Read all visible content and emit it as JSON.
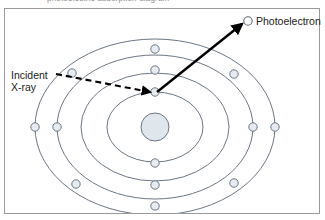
{
  "figure": {
    "caption_sliver": "photoelectric absorption diagram",
    "frame_color": "#9a9a9a",
    "background": "#ffffff"
  },
  "labels": {
    "photoelectron": "Photoelectron",
    "incident_line1": "Incident",
    "incident_line2": "X-ray"
  },
  "diagram": {
    "type": "atomic-shell-photoelectric-effect",
    "nucleus": {
      "name": "nucleus",
      "cx": 155,
      "cy": 127,
      "r": 14,
      "fill": "#dfe6ec",
      "stroke": "#6b7785"
    },
    "shell_color": "#6b7785",
    "electron_fill": "#e6ecf2",
    "electron_stroke": "#6b7785",
    "electron_radius": 4.2,
    "shells": [
      {
        "name": "shell-1",
        "rx": 48,
        "ry": 35
      },
      {
        "name": "shell-2",
        "rx": 74,
        "ry": 54
      },
      {
        "name": "shell-3",
        "rx": 98,
        "ry": 72
      },
      {
        "name": "shell-4",
        "rx": 120,
        "ry": 88
      }
    ],
    "electrons": [
      {
        "name": "electron-shell2-top",
        "cx": 155,
        "cy": 92
      },
      {
        "name": "electron-shell3-top",
        "cx": 155,
        "cy": 70
      },
      {
        "name": "electron-shell4-top",
        "cx": 155,
        "cy": 49
      },
      {
        "name": "electron-shell2-bottom",
        "cx": 155,
        "cy": 163
      },
      {
        "name": "electron-shell3-bottom",
        "cx": 155,
        "cy": 185
      },
      {
        "name": "electron-shell4-bottom",
        "cx": 155,
        "cy": 206
      },
      {
        "name": "electron-shell3-left",
        "cx": 57,
        "cy": 127
      },
      {
        "name": "electron-shell4-left",
        "cx": 35,
        "cy": 127
      },
      {
        "name": "electron-shell3-right",
        "cx": 253,
        "cy": 127
      },
      {
        "name": "electron-shell4-right",
        "cx": 275,
        "cy": 127
      },
      {
        "name": "electron-shell4-upper-left",
        "cx": 72,
        "cy": 73
      },
      {
        "name": "electron-shell4-upper-right",
        "cx": 234,
        "cy": 74
      },
      {
        "name": "electron-shell4-lower-left",
        "cx": 76,
        "cy": 184
      },
      {
        "name": "electron-shell4-lower-right",
        "cx": 234,
        "cy": 183
      }
    ],
    "incident_ray": {
      "name": "incident-xray-arrow",
      "style": "dashed",
      "color": "#000000",
      "x1": 56,
      "y1": 74,
      "x2": 150,
      "y2": 92
    },
    "photoelectron_ray": {
      "name": "photoelectron-arrow",
      "style": "solid",
      "color": "#000000",
      "x1": 157,
      "y1": 92,
      "x2": 242,
      "y2": 24
    },
    "photoelectron_marker": {
      "name": "photoelectron-marker",
      "cx": 248,
      "cy": 21,
      "r": 4.2,
      "fill": "#ffffff",
      "stroke": "#5c6b7a"
    }
  }
}
